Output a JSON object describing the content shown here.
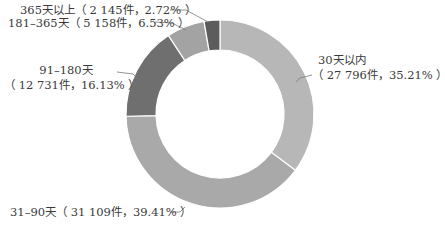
{
  "chart_data": {
    "type": "pie",
    "subtype": "donut",
    "title": "",
    "start_angle_deg": 0,
    "direction": "clockwise",
    "slices": [
      {
        "label": "30天以内",
        "count": 27796,
        "count_text": "27 796件",
        "percent": 35.21,
        "percent_text": "35.21%",
        "color": "#b7b7b7"
      },
      {
        "label": "31–90天",
        "count": 31109,
        "count_text": "31 109件",
        "percent": 39.41,
        "percent_text": "39.41%",
        "color": "#a9a9a9"
      },
      {
        "label": "91–180天",
        "count": 12731,
        "count_text": "12 731件",
        "percent": 16.13,
        "percent_text": "16.13%",
        "color": "#6f6f6f"
      },
      {
        "label": "181–365天",
        "count": 5158,
        "count_text": "5 158件",
        "percent": 6.53,
        "percent_text": "6.53%",
        "color": "#a3a3a3"
      },
      {
        "label": "365天以上",
        "count": 2145,
        "count_text": "2 145件",
        "percent": 2.72,
        "percent_text": "2.72%",
        "color": "#5c5c5c"
      }
    ],
    "legend": "none",
    "labels_outside_with_leader_lines": true
  },
  "labels": {
    "s0_line1": "30天以内",
    "s0_line2": "（ 27 796件，35.21% ）",
    "s1": "31–90天（ 31 109件，39.41% ）",
    "s2_line1": "91–180天",
    "s2_line2": "（ 12 731件，16.13% ）",
    "s3": "181–365天（ 5 158件，6.53% ）",
    "s4": "365天以上（ 2 145件，2.72% ）"
  }
}
